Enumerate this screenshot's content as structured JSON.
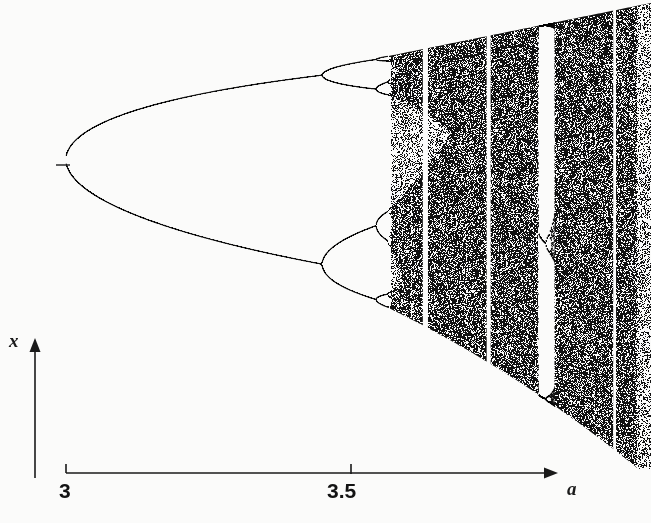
{
  "figure": {
    "kind": "bifurcation-diagram",
    "background_color": "#fbfbfa",
    "ink_color": "#111111"
  },
  "axes": {
    "x_axis": {
      "label": "a",
      "tick_labels": [
        "3",
        "3.5"
      ],
      "tick_values": [
        3,
        3.5
      ],
      "arrow": true,
      "has_line": true
    },
    "y_axis": {
      "label": "x",
      "tick_labels": [],
      "arrow": true,
      "has_line": true
    }
  },
  "chart_data": {
    "type": "scatter",
    "title": "",
    "xlabel": "a",
    "ylabel": "x",
    "xlim": [
      3.0,
      4.03
    ],
    "ylim": [
      0.0,
      1.0
    ],
    "grid": false,
    "legend": null,
    "map_equation": "x_{n+1} = a*x_n*(1 - x_n)",
    "x_tick_labels": [
      "3",
      "3.5"
    ],
    "x_ticks": [
      3.0,
      3.5
    ],
    "pixel_calibration": {
      "x_at_a3": 66,
      "x_at_a35": 351,
      "px_per_unit_a": 570,
      "axis_line_y": 473,
      "plot_top_y": 8,
      "plot_right_x": 651
    },
    "bifurcation_points": [
      {
        "name": "period-1 to period-2",
        "a": 3.0
      },
      {
        "name": "period-2 to period-4",
        "a": 3.449
      },
      {
        "name": "period-4 to period-8",
        "a": 3.544
      },
      {
        "name": "period-8 to period-16",
        "a": 3.5644
      },
      {
        "name": "onset of chaos (Feigenbaum point)",
        "a": 3.5699
      }
    ],
    "periodic_windows": [
      {
        "name": "period-6 window",
        "a_start": 3.626,
        "a_end": 3.635
      },
      {
        "name": "period-5 window",
        "a_start": 3.738,
        "a_end": 3.745
      },
      {
        "name": "period-3 window",
        "a_start": 3.828,
        "a_end": 3.857
      },
      {
        "name": "period-4 window",
        "a_start": 3.96,
        "a_end": 3.965
      }
    ],
    "envelope": {
      "upper_formula": "a/4",
      "lower_formula": "a*(a/4)*(1-a/4)"
    }
  }
}
